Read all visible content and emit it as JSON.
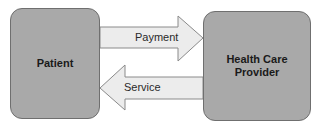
{
  "nodes": {
    "patient": {
      "label": "Patient"
    },
    "provider": {
      "label": "Health Care Provider",
      "line1": "Health Care",
      "line2": "Provider"
    }
  },
  "edges": [
    {
      "from": "patient",
      "to": "provider",
      "label": "Payment"
    },
    {
      "from": "provider",
      "to": "patient",
      "label": "Service"
    }
  ],
  "colors": {
    "box_fill": "#a9a9a9",
    "box_border": "#6f6f6f",
    "arrow_fill": "#ececec",
    "arrow_border": "#8a8a8a"
  }
}
